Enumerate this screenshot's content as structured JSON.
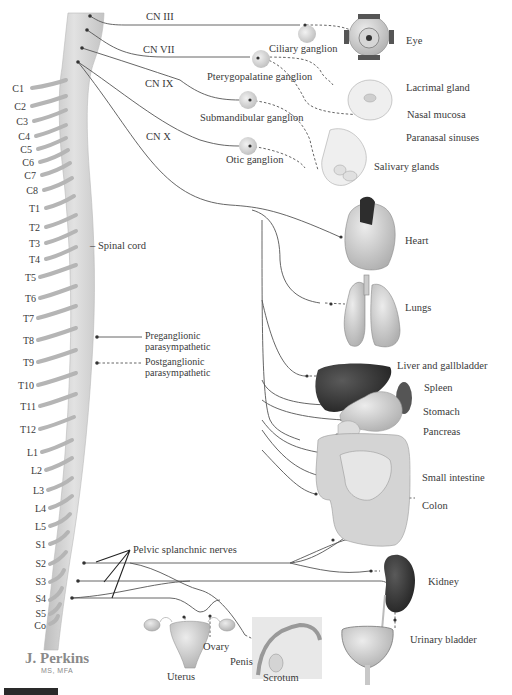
{
  "diagram": {
    "colors": {
      "nerve": "#555555",
      "spine": "#d4d4d4",
      "ganglion": "#d9d9d9",
      "liver": "#3b3b3b",
      "organ": "#c8c8c8"
    },
    "cranial_nerves": [
      {
        "id": "cn3",
        "label": "CN III"
      },
      {
        "id": "cn7",
        "label": "CN VII"
      },
      {
        "id": "cn9",
        "label": "CN IX"
      },
      {
        "id": "cn10",
        "label": "CN X"
      }
    ],
    "ganglia": [
      {
        "id": "ciliary",
        "label": "Ciliary ganglion"
      },
      {
        "id": "pterygopalatine",
        "label": "Pterygopalatine ganglion"
      },
      {
        "id": "submandibular",
        "label": "Submandibular ganglion"
      },
      {
        "id": "otic",
        "label": "Otic ganglion"
      }
    ],
    "spinal_cord_label": "Spinal cord",
    "vertebral_levels": [
      "C1",
      "C2",
      "C3",
      "C4",
      "C5",
      "C6",
      "C7",
      "C8",
      "T1",
      "T2",
      "T3",
      "T4",
      "T5",
      "T6",
      "T7",
      "T8",
      "T9",
      "T10",
      "T11",
      "T12",
      "L1",
      "L2",
      "L3",
      "L4",
      "L5",
      "S1",
      "S2",
      "S3",
      "S4",
      "S5",
      "Co"
    ],
    "legend": {
      "preganglionic": "Preganglionic parasympathetic",
      "preganglionic_line1": "Preganglionic",
      "preganglionic_line2": "parasympathetic",
      "postganglionic_line1": "Postganglionic",
      "postganglionic_line2": "parasympathetic"
    },
    "pelvic_label": "Pelvic splanchnic nerves",
    "targets": [
      {
        "id": "eye",
        "label": "Eye"
      },
      {
        "id": "lacrimal",
        "label": "Lacrimal gland"
      },
      {
        "id": "nasal",
        "label": "Nasal mucosa"
      },
      {
        "id": "paranasal",
        "label": "Paranasal sinuses"
      },
      {
        "id": "salivary",
        "label": "Salivary glands"
      },
      {
        "id": "heart",
        "label": "Heart"
      },
      {
        "id": "lungs",
        "label": "Lungs"
      },
      {
        "id": "liver",
        "label": "Liver and gallbladder"
      },
      {
        "id": "spleen",
        "label": "Spleen"
      },
      {
        "id": "stomach",
        "label": "Stomach"
      },
      {
        "id": "pancreas",
        "label": "Pancreas"
      },
      {
        "id": "small_intestine",
        "label": "Small intestine"
      },
      {
        "id": "colon",
        "label": "Colon"
      },
      {
        "id": "kidney",
        "label": "Kidney"
      },
      {
        "id": "bladder",
        "label": "Urinary bladder"
      },
      {
        "id": "uterus",
        "label": "Uterus"
      },
      {
        "id": "ovary",
        "label": "Ovary"
      },
      {
        "id": "penis",
        "label": "Penis"
      },
      {
        "id": "scrotum",
        "label": "Scrotum"
      }
    ],
    "signature": {
      "name": "J. Perkins",
      "degrees": "MS, MFA"
    }
  }
}
